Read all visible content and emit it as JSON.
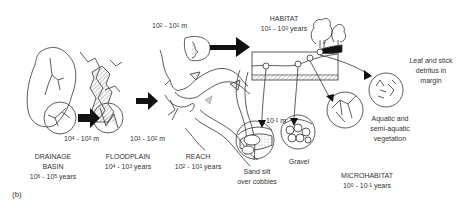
{
  "figure_label": "(b)",
  "scales": [
    {
      "id": "drainage-basin",
      "title_line1": "DRAINAGE",
      "title_line2": "BASIN",
      "time_base": "10",
      "time_exp1": "6",
      "time_mid": " - 10",
      "time_exp2": "5",
      "time_unit": " years"
    },
    {
      "id": "floodplain",
      "title_line1": "FLOODPLAIN",
      "time_base": "10",
      "time_exp1": "4",
      "time_mid": " - 10",
      "time_exp2": "3",
      "time_unit": " years"
    },
    {
      "id": "reach",
      "title_line1": "REACH",
      "time_base": "10",
      "time_exp1": "2",
      "time_mid": " - 10",
      "time_exp2": "1",
      "time_unit": " years"
    },
    {
      "id": "habitat",
      "title_line1": "HABITAT",
      "time_base": "10",
      "time_exp1": "1",
      "time_mid": " - 10",
      "time_exp2": "0",
      "time_unit": " years"
    },
    {
      "id": "microhabitat",
      "title_line1": "MICROHABITAT",
      "time_base": "10",
      "time_exp1": "0",
      "time_mid": " - 10",
      "time_exp2": "-1",
      "time_unit": " years"
    }
  ],
  "spatial_scales": [
    {
      "id": "basin-to-floodplain",
      "base": "10",
      "exp1": "4",
      "mid": " - 10",
      "exp2": "3",
      "unit": " m"
    },
    {
      "id": "floodplain-to-reach",
      "base": "10",
      "exp1": "3",
      "mid": " - 10",
      "exp2": "2",
      "unit": " m"
    },
    {
      "id": "reach-to-habitat",
      "base": "10",
      "exp1": "2",
      "mid": " - 10",
      "exp2": "1",
      "unit": " m"
    },
    {
      "id": "microhabitat-size",
      "base": "10",
      "exp1": "-1",
      "unit": " m"
    }
  ],
  "microhabitats": [
    {
      "id": "sand-silt",
      "line1": "Sand silt",
      "line2": "over cobbles"
    },
    {
      "id": "gravel",
      "line1": "Gravel"
    },
    {
      "id": "vegetation",
      "line1": "Aquatic and",
      "line2": "semi-aquatic",
      "line3": "vegetation"
    },
    {
      "id": "leaf-detritus",
      "line1": "Leaf and stick",
      "line2": "detritus in",
      "line3": "margin"
    }
  ]
}
